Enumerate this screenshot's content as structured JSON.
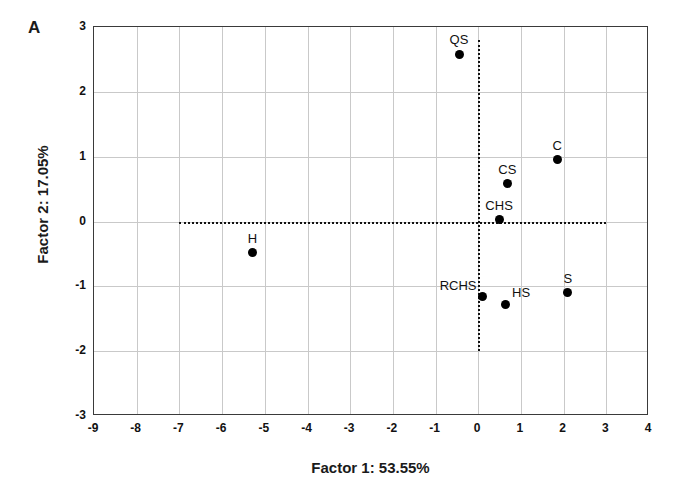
{
  "panel": {
    "label": "A"
  },
  "axes": {
    "xlabel": "Factor 1: 53.55%",
    "ylabel": "Factor 2: 17.05%",
    "xticks": [
      "-9",
      "-8",
      "-7",
      "-6",
      "-5",
      "-4",
      "-3",
      "-2",
      "-1",
      "0",
      "1",
      "2",
      "3",
      "4"
    ],
    "yticks": [
      "3",
      "2",
      "1",
      "0",
      "-1",
      "-2",
      "-3"
    ]
  },
  "chart_data": {
    "type": "scatter",
    "title": "",
    "xlabel": "Factor 1: 53.55%",
    "ylabel": "Factor 2: 17.05%",
    "xlim": [
      -9,
      4
    ],
    "ylim": [
      -3,
      3
    ],
    "xticks": [
      -9,
      -8,
      -7,
      -6,
      -5,
      -4,
      -3,
      -2,
      -1,
      0,
      1,
      2,
      3,
      4
    ],
    "yticks": [
      -3,
      -2,
      -1,
      0,
      1,
      2,
      3
    ],
    "grid": true,
    "legend": "none",
    "reference_lines": [
      {
        "orientation": "horizontal",
        "value": 0,
        "style": "dotted",
        "from": -7,
        "to": 3
      },
      {
        "orientation": "vertical",
        "value": 0,
        "style": "dotted",
        "from": -2,
        "to": 2.8
      }
    ],
    "points": [
      {
        "label": "QS",
        "x": -0.45,
        "y": 2.58,
        "label_pos": "above"
      },
      {
        "label": "C",
        "x": 1.85,
        "y": 0.95,
        "label_pos": "above"
      },
      {
        "label": "CS",
        "x": 0.68,
        "y": 0.58,
        "label_pos": "above"
      },
      {
        "label": "CHS",
        "x": 0.49,
        "y": 0.03,
        "label_pos": "above"
      },
      {
        "label": "H",
        "x": -5.29,
        "y": -0.48,
        "label_pos": "above"
      },
      {
        "label": "RCHS",
        "x": 0.09,
        "y": -1.16,
        "label_pos": "above-left"
      },
      {
        "label": "HS",
        "x": 0.63,
        "y": -1.28,
        "label_pos": "above-right"
      },
      {
        "label": "S",
        "x": 2.1,
        "y": -1.1,
        "label_pos": "above"
      }
    ]
  },
  "colors": {
    "marker": "#000000",
    "frame": "#3a3a3a",
    "grid": "#c9c9c9",
    "reference": "#111111",
    "background": "#ffffff"
  }
}
